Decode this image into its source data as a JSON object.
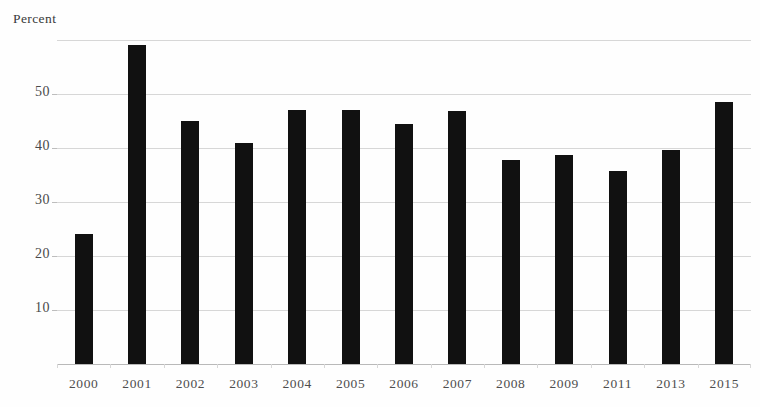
{
  "chart_data": {
    "type": "bar",
    "title": "",
    "subtitle": "",
    "ylabel": "Percent",
    "xlabel": "",
    "categories": [
      "2000",
      "2001",
      "2002",
      "2003",
      "2004",
      "2005",
      "2006",
      "2007",
      "2008",
      "2009",
      "2011",
      "2013",
      "2015"
    ],
    "values": [
      24.0,
      59.0,
      45.0,
      41.0,
      47.0,
      47.0,
      44.5,
      46.8,
      37.8,
      38.7,
      35.7,
      39.6,
      48.5
    ],
    "series": [
      {
        "name": "Percent",
        "values": [
          24.0,
          59.0,
          45.0,
          41.0,
          47.0,
          47.0,
          44.5,
          46.8,
          37.8,
          38.7,
          35.7,
          39.6,
          48.5
        ]
      }
    ],
    "ylim": [
      0,
      60
    ],
    "ytick_labels": [
      "10",
      "20",
      "30",
      "40",
      "50"
    ],
    "ytick_values": [
      10,
      20,
      30,
      40,
      50
    ],
    "gridlines": [
      10,
      20,
      30,
      40,
      50,
      60
    ],
    "grid": true,
    "legend": null,
    "legend_position": "none",
    "bar_color": "#111111",
    "grid_color": "#d7d7d7",
    "axis_color": "#b9b9b9",
    "background": "#fefefe",
    "annotations": []
  },
  "labels": {
    "axis_title": "Percent"
  }
}
